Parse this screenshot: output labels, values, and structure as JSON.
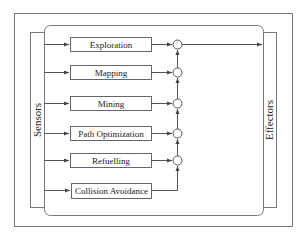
{
  "diagram": {
    "sensors_label": "Sensors",
    "effectors_label": "Effectors",
    "behaviors": [
      {
        "label": "Exploration"
      },
      {
        "label": "Mapping"
      },
      {
        "label": "Mining"
      },
      {
        "label": "Path Optimization"
      },
      {
        "label": "Refuelling"
      },
      {
        "label": "Collision Avoidance"
      }
    ],
    "colors": {
      "line": "#555555",
      "box_stroke": "#666666",
      "text": "#222222",
      "background": "#ffffff"
    }
  }
}
